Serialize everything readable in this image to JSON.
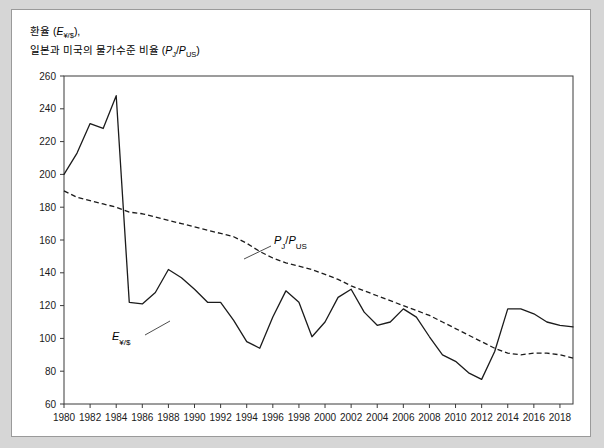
{
  "figure": {
    "title_line1": "환율 (E¥/$),",
    "title_line2": "일본과 미국의 물가수준 비율 (PJ/PUS)",
    "title_l1_prefix": "환율 (",
    "title_l1_sym": "E",
    "title_l1_sub": "¥/$",
    "title_l1_suffix": "),",
    "title_l2_prefix": "일본과 미국의 물가수준 비율 (",
    "title_l2_sym1": "P",
    "title_l2_sub1": "J",
    "title_l2_slash": "/",
    "title_l2_sym2": "P",
    "title_l2_sub2": "US",
    "title_l2_suffix": ")"
  },
  "annotations": {
    "exchange_rate": {
      "sym": "E",
      "sub": "¥/$"
    },
    "price_ratio": {
      "sym1": "P",
      "sub1": "J",
      "slash": "/",
      "sym2": "P",
      "sub2": "US"
    }
  },
  "chart_data": {
    "type": "line",
    "title": "환율 (E¥/$), 일본과 미국의 물가수준 비율 (PJ/PUS)",
    "xlabel": "",
    "ylabel": "",
    "xlim": [
      1980,
      2019
    ],
    "ylim": [
      60,
      260
    ],
    "ytick_step": 20,
    "xtick_step": 2,
    "grid": false,
    "legend_position": "inline-annotations",
    "yticks": [
      60,
      80,
      100,
      120,
      140,
      160,
      180,
      200,
      220,
      240,
      260
    ],
    "xticks": [
      1980,
      1982,
      1984,
      1986,
      1988,
      1990,
      1992,
      1994,
      1996,
      1998,
      2000,
      2002,
      2004,
      2006,
      2008,
      2010,
      2012,
      2014,
      2016,
      2018
    ],
    "x": [
      1980,
      1981,
      1982,
      1983,
      1984,
      1985,
      1986,
      1987,
      1988,
      1989,
      1990,
      1991,
      1992,
      1993,
      1994,
      1995,
      1996,
      1997,
      1998,
      1999,
      2000,
      2001,
      2002,
      2003,
      2004,
      2005,
      2006,
      2007,
      2008,
      2009,
      2010,
      2011,
      2012,
      2013,
      2014,
      2015,
      2016,
      2017,
      2018,
      2019
    ],
    "series": [
      {
        "name": "E¥/$",
        "style": "solid",
        "values": [
          200,
          213,
          231,
          228,
          248,
          122,
          121,
          128,
          142,
          137,
          130,
          122,
          122,
          111,
          98,
          94,
          113,
          129,
          122,
          101,
          110,
          125,
          130,
          116,
          108,
          110,
          118,
          113,
          101,
          90,
          86,
          79,
          75,
          92,
          118,
          118,
          115,
          110,
          108,
          107
        ]
      },
      {
        "name": "PJ/PUS",
        "style": "dashed",
        "values": [
          190,
          186,
          184,
          182,
          180,
          177,
          176,
          174,
          172,
          170,
          168,
          166,
          164,
          162,
          158,
          153,
          149,
          146,
          144,
          142,
          139,
          136,
          132,
          129,
          126,
          123,
          120,
          117,
          114,
          110,
          106,
          102,
          98,
          94,
          91,
          90,
          91,
          91,
          90,
          88
        ]
      }
    ]
  }
}
